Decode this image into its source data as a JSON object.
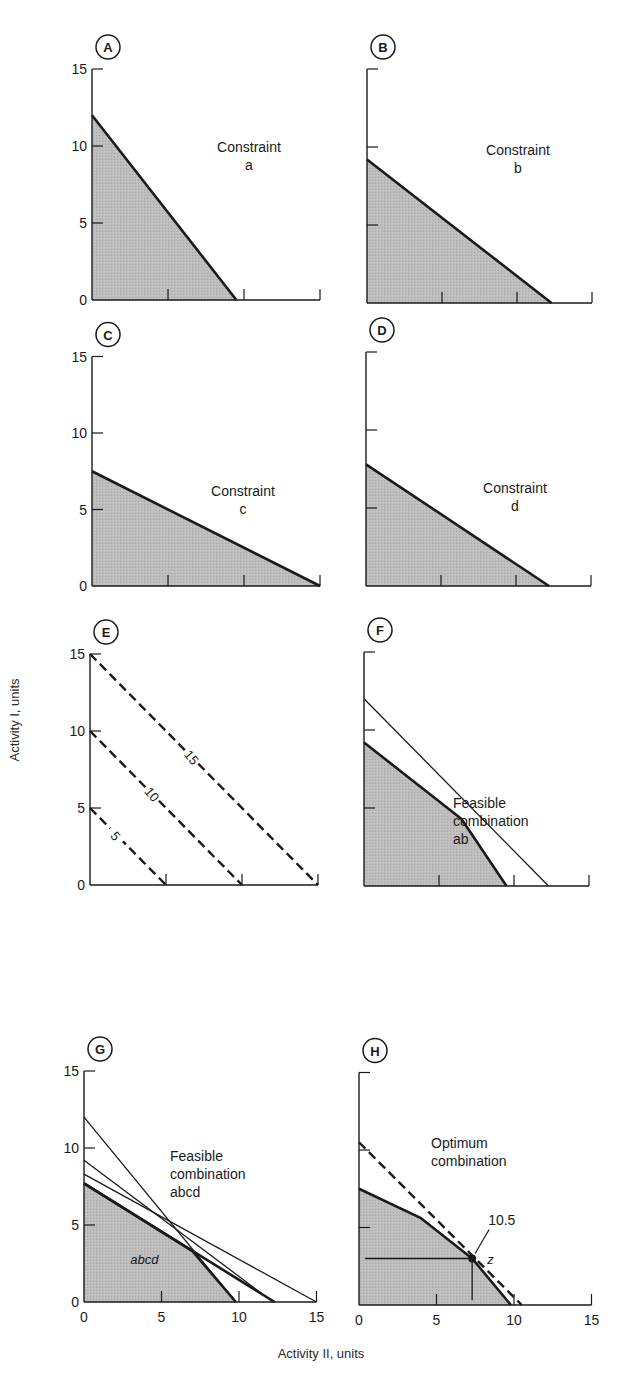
{
  "figure": {
    "y_axis_label": "Activity I, units",
    "x_axis_label": "Activity II, units",
    "colors": {
      "ink": "#1a1a1a",
      "shade": "#b8b8b8",
      "background": "#ffffff"
    }
  },
  "chart_data": [
    {
      "panel": "A",
      "type": "area",
      "title": "Constraint a",
      "text": [
        "Constraint",
        "a"
      ],
      "xlim": [
        0,
        15
      ],
      "ylim": [
        0,
        15
      ],
      "yticks": [
        0,
        5,
        10,
        15
      ],
      "ytick_labels_shown": true,
      "xticks": [
        5,
        10,
        15
      ],
      "xtick_labels_shown": false,
      "feasible_region": [
        [
          0,
          0
        ],
        [
          0,
          12
        ],
        [
          9.5,
          0
        ]
      ],
      "lines": [
        {
          "name": "a",
          "points": [
            [
              0,
              12
            ],
            [
              9.5,
              0
            ]
          ],
          "style": "thick"
        }
      ]
    },
    {
      "panel": "B",
      "type": "area",
      "title": "Constraint b",
      "text": [
        "Constraint",
        "b"
      ],
      "xlim": [
        0,
        15
      ],
      "ylim": [
        0,
        15
      ],
      "yticks": [
        0,
        5,
        10,
        15
      ],
      "ytick_labels_shown": false,
      "xticks": [
        5,
        10,
        15
      ],
      "xtick_labels_shown": false,
      "feasible_region": [
        [
          0,
          0
        ],
        [
          0,
          9.2
        ],
        [
          12.3,
          0
        ]
      ],
      "lines": [
        {
          "name": "b",
          "points": [
            [
              0,
              9.2
            ],
            [
              12.3,
              0
            ]
          ],
          "style": "thick"
        }
      ]
    },
    {
      "panel": "C",
      "type": "area",
      "title": "Constraint c",
      "text": [
        "Constraint",
        "c"
      ],
      "xlim": [
        0,
        15
      ],
      "ylim": [
        0,
        15
      ],
      "yticks": [
        0,
        5,
        10,
        15
      ],
      "ytick_labels_shown": true,
      "xticks": [
        5,
        10,
        15
      ],
      "xtick_labels_shown": false,
      "feasible_region": [
        [
          0,
          0
        ],
        [
          0,
          7.5
        ],
        [
          15,
          0
        ]
      ],
      "lines": [
        {
          "name": "c",
          "points": [
            [
              0,
              7.5
            ],
            [
              15,
              0
            ]
          ],
          "style": "thick"
        }
      ]
    },
    {
      "panel": "D",
      "type": "area",
      "title": "Constraint d",
      "text": [
        "Constraint",
        "d"
      ],
      "xlim": [
        0,
        15
      ],
      "ylim": [
        0,
        15
      ],
      "yticks": [
        0,
        5,
        10,
        15
      ],
      "ytick_labels_shown": false,
      "xticks": [
        5,
        10,
        15
      ],
      "xtick_labels_shown": false,
      "feasible_region": [
        [
          0,
          0
        ],
        [
          0,
          7.8
        ],
        [
          12.2,
          0
        ]
      ],
      "lines": [
        {
          "name": "d",
          "points": [
            [
              0,
              7.8
            ],
            [
              12.2,
              0
            ]
          ],
          "style": "thick"
        }
      ]
    },
    {
      "panel": "E",
      "type": "line",
      "title": "Iso-profit lines",
      "text": [],
      "xlim": [
        0,
        15
      ],
      "ylim": [
        0,
        15
      ],
      "yticks": [
        0,
        5,
        10,
        15
      ],
      "ytick_labels_shown": true,
      "xticks": [
        5,
        10,
        15
      ],
      "xtick_labels_shown": false,
      "feasible_region": [],
      "lines": [
        {
          "name": "5",
          "points": [
            [
              0,
              5
            ],
            [
              5,
              0
            ]
          ],
          "style": "dashed",
          "label": "5",
          "label_at": [
            1.7,
            3.2
          ]
        },
        {
          "name": "10",
          "points": [
            [
              0,
              10
            ],
            [
              10,
              0
            ]
          ],
          "style": "dashed",
          "label": "10",
          "label_at": [
            4.1,
            5.9
          ]
        },
        {
          "name": "15",
          "points": [
            [
              0,
              15
            ],
            [
              15,
              0
            ]
          ],
          "style": "dashed",
          "label": "15",
          "label_at": [
            6.7,
            8.3
          ]
        }
      ]
    },
    {
      "panel": "F",
      "type": "area",
      "title": "Feasible combination ab",
      "text": [
        "Feasible",
        "combination",
        "ab"
      ],
      "xlim": [
        0,
        15
      ],
      "ylim": [
        0,
        15
      ],
      "yticks": [
        0,
        5,
        10,
        15
      ],
      "ytick_labels_shown": false,
      "xticks": [
        5,
        10,
        15
      ],
      "xtick_labels_shown": false,
      "feasible_region": [
        [
          0,
          0
        ],
        [
          0,
          9.2
        ],
        [
          6.5,
          4.3
        ],
        [
          9.5,
          0
        ]
      ],
      "lines": [
        {
          "name": "a",
          "points": [
            [
              0,
              12
            ],
            [
              12.3,
              0
            ]
          ],
          "style": "thin"
        },
        {
          "name": "b",
          "points": [
            [
              0,
              9.2
            ],
            [
              9.6,
              0
            ]
          ],
          "style": "thin-hidden"
        },
        {
          "name": "boundary",
          "points": [
            [
              0,
              9.2
            ],
            [
              6.5,
              4.3
            ],
            [
              9.5,
              0
            ]
          ],
          "style": "thick"
        }
      ]
    },
    {
      "panel": "G",
      "type": "area",
      "title": "Feasible combination abcd",
      "text": [
        "Feasible",
        "combination",
        "abcd"
      ],
      "region_label": "abcd",
      "region_label_at": [
        3.5,
        2.5
      ],
      "xlim": [
        0,
        15
      ],
      "ylim": [
        0,
        15
      ],
      "yticks": [
        0,
        5,
        10,
        15
      ],
      "ytick_labels_shown": true,
      "xticks": [
        5,
        10,
        15
      ],
      "xtick_labels": [
        "0",
        "5",
        "10",
        "15"
      ],
      "xtick_labels_shown": true,
      "feasible_region": [
        [
          0,
          0
        ],
        [
          0,
          7.7
        ],
        [
          7.0,
          3.3
        ],
        [
          9.8,
          0
        ]
      ],
      "lines": [
        {
          "name": "a",
          "points": [
            [
              0,
              12
            ],
            [
              9.8,
              0
            ]
          ],
          "style": "thin"
        },
        {
          "name": "b",
          "points": [
            [
              0,
              9.2
            ],
            [
              12.2,
              0
            ]
          ],
          "style": "thin"
        },
        {
          "name": "c",
          "points": [
            [
              0,
              8.3
            ],
            [
              15,
              0
            ]
          ],
          "style": "thin"
        },
        {
          "name": "d",
          "points": [
            [
              0,
              7.7
            ],
            [
              12.3,
              0
            ]
          ],
          "style": "thick"
        },
        {
          "name": "boundary",
          "points": [
            [
              0,
              7.7
            ],
            [
              7.0,
              3.3
            ],
            [
              9.8,
              0
            ]
          ],
          "style": "thick"
        }
      ]
    },
    {
      "panel": "H",
      "type": "area",
      "title": "Optimum combination",
      "text": [
        "Optimum",
        "combination"
      ],
      "xlim": [
        0,
        15
      ],
      "ylim": [
        0,
        15
      ],
      "yticks": [
        0,
        5,
        10,
        15
      ],
      "ytick_labels_shown": false,
      "xticks": [
        5,
        10,
        15
      ],
      "xtick_labels": [
        "0",
        "5",
        "10",
        "15"
      ],
      "xtick_labels_shown": true,
      "feasible_region": [
        [
          0,
          0
        ],
        [
          0,
          7.5
        ],
        [
          4.0,
          5.6
        ],
        [
          7.3,
          3.0
        ],
        [
          9.8,
          0
        ]
      ],
      "lines": [
        {
          "name": "boundary",
          "points": [
            [
              0,
              7.5
            ],
            [
              4.0,
              5.6
            ],
            [
              7.3,
              3.0
            ],
            [
              9.8,
              0
            ]
          ],
          "style": "thick"
        },
        {
          "name": "iso-profit 10.5",
          "points": [
            [
              0,
              10.5
            ],
            [
              10.5,
              0
            ]
          ],
          "style": "dashed"
        },
        {
          "name": "guide-h",
          "points": [
            [
              0.4,
              3.0
            ],
            [
              7.3,
              3.0
            ]
          ],
          "style": "thin"
        },
        {
          "name": "guide-v",
          "points": [
            [
              7.3,
              3.0
            ],
            [
              7.3,
              0.3
            ]
          ],
          "style": "thin"
        }
      ],
      "optimum_point": {
        "label": "z",
        "x": 7.3,
        "y": 3.0,
        "value_label": "10.5"
      }
    }
  ]
}
